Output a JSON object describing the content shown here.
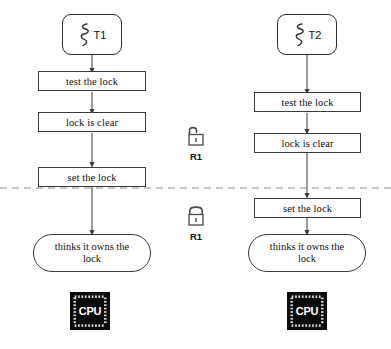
{
  "diagram": {
    "divider": {
      "name": "preemption-line",
      "style": "dashed",
      "color": "#8a8a8a",
      "y": 188
    },
    "columns": [
      {
        "id": "thread-1",
        "thread": {
          "label": "T1",
          "icon": "thread-squiggle-icon"
        },
        "steps": [
          {
            "label": "test the lock",
            "shape": "rect"
          },
          {
            "label": "lock is clear",
            "shape": "rect"
          },
          {
            "label": "set the lock",
            "shape": "rect"
          },
          {
            "label": "thinks it owns the lock",
            "shape": "stadium"
          }
        ],
        "cpu": {
          "label": "CPU",
          "icon": "cpu-chip-icon"
        }
      },
      {
        "id": "thread-2",
        "thread": {
          "label": "T2",
          "icon": "thread-squiggle-icon"
        },
        "steps": [
          {
            "label": "test the lock",
            "shape": "rect"
          },
          {
            "label": "lock is clear",
            "shape": "rect"
          },
          {
            "label": "set the lock",
            "shape": "rect"
          },
          {
            "label": "thinks it owns the lock",
            "shape": "stadium"
          }
        ],
        "cpu": {
          "label": "CPU",
          "icon": "cpu-chip-icon"
        }
      }
    ],
    "locks": [
      {
        "id": "lock-open",
        "label": "R1",
        "state": "unlocked",
        "icon": "padlock-open-icon"
      },
      {
        "id": "lock-closed",
        "label": "R1",
        "state": "locked",
        "icon": "padlock-closed-icon"
      }
    ],
    "colors": {
      "stroke": "#3a3a3a",
      "text": "#111111",
      "divider": "#8a8a8a",
      "cpu_body": "#0a0a0a",
      "cpu_text": "#ffffff",
      "background": "#ffffff"
    }
  }
}
